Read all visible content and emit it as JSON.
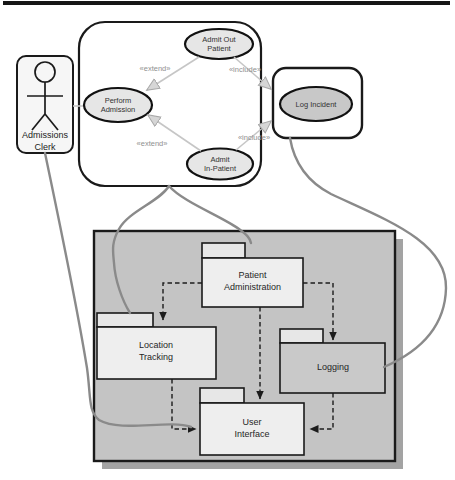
{
  "use_case_diagram": {
    "actor": {
      "label": "Admissions\nClerk"
    },
    "use_cases": {
      "perform_admission": "Perform\nAdmission",
      "admit_out_patient": "Admit Out\nPatient",
      "admit_in_patient": "Admit\nIn-Patient",
      "log_incident": "Log Incident"
    },
    "stereotypes": {
      "extend_top": "«extend»",
      "extend_bottom": "«extend»",
      "include_top": "«include»",
      "include_bottom": "«include»"
    }
  },
  "package_diagram": {
    "packages": {
      "patient_administration": "Patient\nAdministration",
      "location_tracking": "Location\nTracking",
      "logging": "Logging",
      "user_interface": "User\nInterface"
    }
  },
  "colors": {
    "top_rule": "#161616",
    "use_case_fill": "#e6e6e6",
    "log_incident_fill": "#c8c8c8",
    "panel_fill": "#c4c4c4",
    "panel_shadow": "#a3a3a3",
    "package_fill": "#eeeeee",
    "package_tab_fill": "#e7e7e7",
    "logging_fill": "#c9c9c9",
    "connector_stroke": "#8a8a8a",
    "relationship_stroke": "#c6c6c6"
  }
}
